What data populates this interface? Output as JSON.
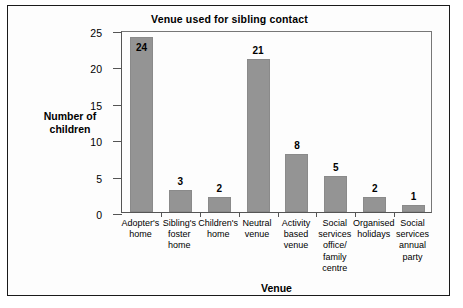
{
  "chart_data": {
    "type": "bar",
    "title": "Venue used for sibling contact",
    "xlabel": "Venue",
    "ylabel": "Number of children",
    "ylim": [
      0,
      25
    ],
    "yticks": [
      0,
      5,
      10,
      15,
      20,
      25
    ],
    "grid": false,
    "legend": null,
    "bar_color": "#949494",
    "categories": [
      "Adopter's home",
      "Sibling's foster home",
      "Children's home",
      "Neutral venue",
      "Activity based venue",
      "Social services office/ family centre",
      "Organised holidays",
      "Social services annual party"
    ],
    "category_lines": [
      [
        "Adopter's",
        "home"
      ],
      [
        "Sibling's",
        "foster",
        "home"
      ],
      [
        "Children's",
        "home"
      ],
      [
        "Neutral",
        "venue"
      ],
      [
        "Activity",
        "based",
        "venue"
      ],
      [
        "Social",
        "services",
        "office/",
        "family",
        "centre"
      ],
      [
        "Organised",
        "holidays"
      ],
      [
        "Social",
        "services",
        "annual",
        "party"
      ]
    ],
    "values": [
      24,
      3,
      2,
      21,
      8,
      5,
      2,
      1
    ],
    "value_labels": [
      "24",
      "3",
      "2",
      "21",
      "8",
      "5",
      "2",
      "1"
    ]
  },
  "axis": {
    "y_title_lines": [
      "Number of",
      "children"
    ],
    "y_tick_labels": [
      "0",
      "5",
      "10",
      "15",
      "20",
      "25"
    ]
  }
}
